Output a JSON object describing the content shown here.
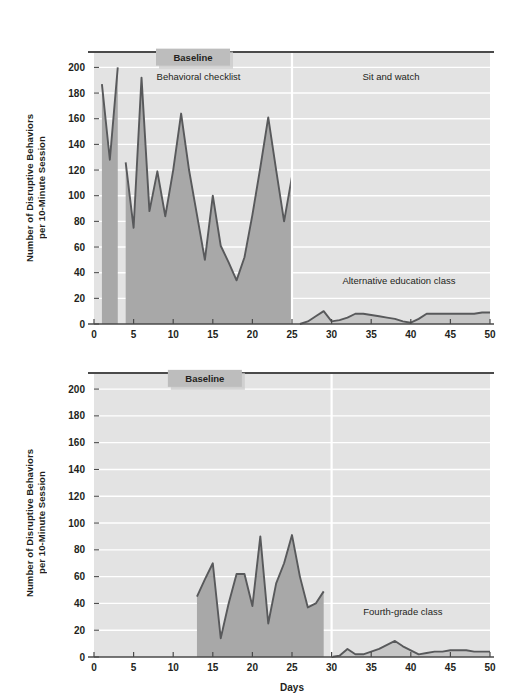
{
  "figure": {
    "background": "#ffffff",
    "plot_background": "#e3e3e3",
    "gridline_color": "#ffffff",
    "area_fill_baseline": "#a8a8a8",
    "area_fill_treatment": "#c6c6c6",
    "line_color": "#58595b",
    "axis_color": "#3b3b3b",
    "baseline_box_fill": "#bdbdbd"
  },
  "axis": {
    "xlabel": "Days",
    "ylabel": "Number of Disruptive Behaviors\nper 10-Minute Session",
    "xticks": [
      0,
      5,
      10,
      15,
      20,
      25,
      30,
      35,
      40,
      45,
      50
    ],
    "xtick_labels": [
      "0",
      "5",
      "10",
      "15",
      "20",
      "25",
      "30",
      "35",
      "40",
      "45",
      "50"
    ],
    "yticks": [
      0,
      20,
      40,
      60,
      80,
      100,
      120,
      140,
      160,
      180,
      200
    ],
    "ytick_labels": [
      "0",
      "20",
      "40",
      "60",
      "80",
      "100",
      "120",
      "140",
      "160",
      "180",
      "200"
    ],
    "xlim": [
      0,
      50
    ],
    "ylim": [
      0,
      212
    ],
    "grid": "horizontal-only"
  },
  "chart_data": [
    {
      "id": "top-panel",
      "type": "area",
      "title": "",
      "xlabel": "",
      "ylabel": "Number of Disruptive Behaviors per 10-Minute Session",
      "xlim": [
        0,
        50
      ],
      "ylim": [
        0,
        212
      ],
      "grid": true,
      "legend": "none",
      "annotations": [
        {
          "name": "baseline-box",
          "text": "Baseline",
          "x": 12.5,
          "y": 208,
          "boxed": true
        },
        {
          "name": "phase-label-1",
          "text": "Behavioral checklist",
          "x": 13.2,
          "y": 190
        },
        {
          "name": "phase-label-2",
          "text": "Sit and watch",
          "x": 37.5,
          "y": 190
        },
        {
          "name": "phase-label-3",
          "text": "Alternative education class",
          "x": 38.5,
          "y": 31
        }
      ],
      "phase_change_lines": [
        25
      ],
      "series": [
        {
          "name": "Baseline - behavioral checklist",
          "phase": "baseline",
          "x": [
            1,
            2,
            3
          ],
          "values": [
            187,
            128,
            200
          ]
        },
        {
          "name": "Baseline continued",
          "phase": "baseline",
          "x": [
            4,
            5,
            6,
            7,
            8,
            9,
            10,
            11,
            12,
            13,
            14,
            15,
            16,
            17,
            18,
            19,
            20,
            21,
            22,
            23,
            24,
            25
          ],
          "values": [
            126,
            75,
            192,
            88,
            119,
            84,
            120,
            164,
            120,
            85,
            50,
            100,
            61,
            48,
            34,
            52,
            85,
            122,
            161,
            120,
            80,
            115
          ]
        },
        {
          "name": "Sit and watch / Alternative education class",
          "phase": "treatment",
          "x": [
            26,
            27,
            28,
            29,
            30,
            31,
            32,
            33,
            34,
            35,
            36,
            37,
            38,
            39,
            40,
            41,
            42,
            43,
            44,
            45,
            46,
            47,
            48,
            49,
            50
          ],
          "values": [
            0,
            2,
            6,
            10,
            2,
            3,
            5,
            8,
            8,
            7,
            6,
            5,
            4,
            2,
            1,
            4,
            8,
            8,
            8,
            8,
            8,
            8,
            8,
            9,
            9
          ]
        }
      ]
    },
    {
      "id": "bottom-panel",
      "type": "area",
      "title": "",
      "xlabel": "Days",
      "ylabel": "Number of Disruptive Behaviors per 10-Minute Session",
      "xlim": [
        0,
        50
      ],
      "ylim": [
        0,
        212
      ],
      "grid": true,
      "legend": "none",
      "annotations": [
        {
          "name": "baseline-box",
          "text": "Baseline",
          "x": 14.0,
          "y": 208,
          "boxed": true
        },
        {
          "name": "phase-label-1",
          "text": "Fourth-grade class",
          "x": 39.0,
          "y": 31
        }
      ],
      "phase_change_lines": [
        30
      ],
      "series": [
        {
          "name": "Baseline",
          "phase": "baseline",
          "x": [
            13,
            14,
            15,
            16,
            17,
            18,
            19,
            20,
            21,
            22,
            23,
            24,
            25,
            26,
            27,
            28,
            29
          ],
          "values": [
            45,
            58,
            70,
            14,
            40,
            62,
            62,
            38,
            90,
            25,
            55,
            70,
            91,
            60,
            37,
            40,
            49
          ]
        },
        {
          "name": "Fourth-grade class",
          "phase": "treatment",
          "x": [
            30,
            31,
            32,
            33,
            34,
            35,
            36,
            37,
            38,
            39,
            40,
            41,
            42,
            43,
            44,
            45,
            46,
            47,
            48,
            49,
            50
          ],
          "values": [
            0,
            1,
            6,
            2,
            2,
            4,
            6,
            9,
            12,
            8,
            5,
            2,
            3,
            4,
            4,
            5,
            5,
            5,
            4,
            4,
            4
          ]
        }
      ]
    }
  ]
}
